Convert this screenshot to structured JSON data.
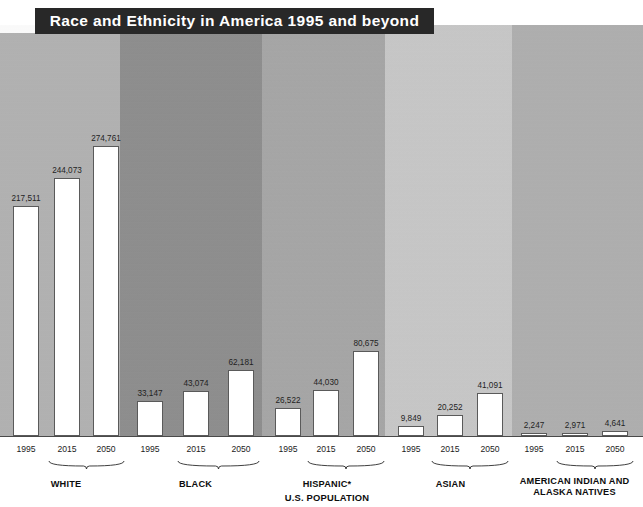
{
  "title": "Race and Ethnicity in America 1995 and beyond",
  "subtitle": "U.S. POPULATION",
  "projected_label": "Projected",
  "colors": {
    "title_bar": "#282828",
    "title_text": "#ffffff",
    "bar_fill": "#ffffff",
    "bar_border": "#5a5a5a",
    "baseline": "#4a4a4a",
    "band_white": "#b3b3b3",
    "band_black": "#8e8e8e",
    "band_hispanic": "#a7a7a7",
    "band_asian": "#c9c9c9",
    "band_native": "#b0b0b0"
  },
  "chart_data": {
    "type": "bar",
    "title": "Race and Ethnicity in America 1995 and beyond",
    "subtitle": "U.S. POPULATION",
    "xlabel": "",
    "ylabel": "",
    "unit": "thousands of people",
    "grid": false,
    "legend": false,
    "ylim": [
      0,
      274761
    ],
    "categories": [
      "1995",
      "2015",
      "2050"
    ],
    "projected_categories": [
      "2015",
      "2050"
    ],
    "groups": [
      {
        "name": "WHITE",
        "values": [
          217511,
          244073,
          274761
        ],
        "value_labels": [
          "217,511",
          "244,073",
          "274,761"
        ],
        "band_color": "#b3b3b3"
      },
      {
        "name": "BLACK",
        "values": [
          33147,
          43074,
          62181
        ],
        "value_labels": [
          "33,147",
          "43,074",
          "62,181"
        ],
        "band_color": "#8e8e8e"
      },
      {
        "name": "HISPANIC*",
        "values": [
          26522,
          44030,
          80675
        ],
        "value_labels": [
          "26,522",
          "44,030",
          "80,675"
        ],
        "band_color": "#a7a7a7"
      },
      {
        "name": "ASIAN",
        "values": [
          9849,
          20252,
          41091
        ],
        "value_labels": [
          "9,849",
          "20,252",
          "41,091"
        ],
        "band_color": "#c9c9c9"
      },
      {
        "name": "AMERICAN INDIAN AND ALASKA NATIVES",
        "values": [
          2247,
          2971,
          4641
        ],
        "value_labels": [
          "2,247",
          "2,971",
          "4,641"
        ],
        "band_color": "#b0b0b0"
      }
    ]
  }
}
